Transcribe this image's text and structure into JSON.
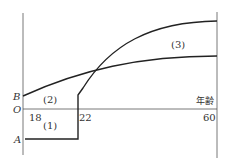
{
  "diagram": {
    "axis_labels": {
      "origin": "O",
      "A": "A",
      "B": "B",
      "x_axis": "年齢"
    },
    "ticks": [
      "18",
      "22",
      "60"
    ],
    "regions": [
      "(1)",
      "(2)",
      "(3)"
    ],
    "colors": {
      "line": "#222222",
      "axis": "#555555",
      "background": "#ffffff"
    }
  }
}
